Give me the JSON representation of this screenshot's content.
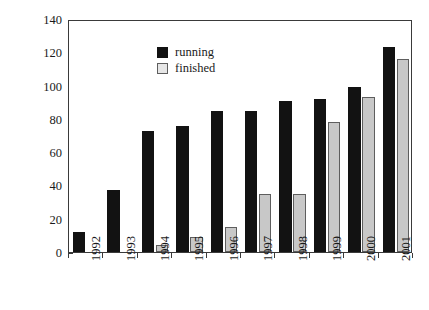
{
  "chart_data": {
    "type": "bar",
    "title": "",
    "xlabel": "",
    "ylabel": "Number of actions",
    "categories": [
      "1992",
      "1993",
      "1994",
      "1995",
      "1996",
      "1997",
      "1998",
      "1999",
      "2000",
      "2001"
    ],
    "series": [
      {
        "name": "running",
        "color": "#121212",
        "values": [
          12,
          37,
          73,
          76,
          85,
          85,
          91,
          92,
          99,
          123
        ]
      },
      {
        "name": "finished",
        "color": "#c8c8c8",
        "values": [
          0,
          0,
          4,
          9,
          15,
          35,
          35,
          78,
          93,
          116
        ]
      }
    ],
    "ylim": [
      0,
      140
    ],
    "yticks": [
      0,
      20,
      40,
      60,
      80,
      100,
      120,
      140
    ],
    "ytick_labels": [
      "0",
      "20",
      "40",
      "60",
      "80",
      "100",
      "120",
      "140"
    ],
    "grid": false,
    "legend_position": "top-left",
    "legend_entries": [
      "running",
      "finished"
    ]
  }
}
